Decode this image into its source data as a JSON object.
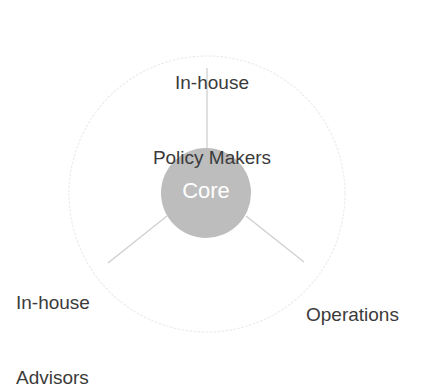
{
  "diagram": {
    "type": "hub-and-spoke",
    "center": {
      "label": "Core",
      "cx": 206,
      "cy": 193,
      "r": 45,
      "fill": "#bdbdbd",
      "text_color": "#ffffff"
    },
    "outer_circle": {
      "cx": 207,
      "cy": 194,
      "r": 138,
      "stroke": "#ededed",
      "style": "dotted"
    },
    "spoke_color": "#d0d0d0",
    "label_color": "#3b3b3b",
    "nodes": [
      {
        "id": "policy-makers",
        "label": "In-house\nPolicy Makers",
        "line1": "In-house",
        "line2": "Policy Makers",
        "angle_deg": 90,
        "position": "top"
      },
      {
        "id": "advisors",
        "label": "In-house\nAdvisors",
        "line1": "In-house",
        "line2": "Advisors",
        "angle_deg": 210,
        "position": "bottom-left"
      },
      {
        "id": "operations",
        "label": "Operations",
        "line1": "Operations",
        "line2": "",
        "angle_deg": 330,
        "position": "bottom-right"
      }
    ]
  }
}
